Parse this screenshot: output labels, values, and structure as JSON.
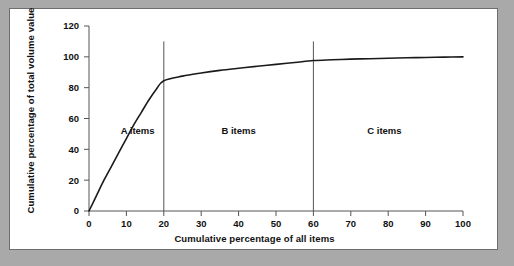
{
  "figure": {
    "background_color": "#a9a9a9",
    "panel_color": "#ffffff",
    "panel_border_color": "#6e6e6e"
  },
  "chart_data": {
    "type": "line",
    "title": "",
    "subtitle": "",
    "xlabel": "Cumulative percentage of all items",
    "ylabel": "Cumulative percentage of total volume value",
    "xlim": [
      0,
      100
    ],
    "ylim": [
      0,
      120
    ],
    "xticks": [
      0,
      10,
      20,
      30,
      40,
      50,
      60,
      70,
      80,
      90,
      100
    ],
    "yticks": [
      0,
      20,
      40,
      60,
      80,
      100,
      120
    ],
    "xtick_labels": [
      "0",
      "10",
      "20",
      "30",
      "40",
      "50",
      "60",
      "70",
      "80",
      "90",
      "100"
    ],
    "ytick_labels": [
      "0",
      "20",
      "40",
      "60",
      "80",
      "100",
      "120"
    ],
    "grid": false,
    "legend": false,
    "legend_position": "none",
    "line_color": "#1a1a1a",
    "line_width": 1.6,
    "series": [
      {
        "name": "Cumulative value curve",
        "x": [
          0,
          2,
          4,
          6,
          8,
          10,
          12,
          14,
          16,
          18,
          20,
          25,
          30,
          35,
          40,
          45,
          50,
          55,
          60,
          65,
          70,
          75,
          80,
          85,
          90,
          95,
          100
        ],
        "values": [
          0,
          10,
          20,
          29,
          38,
          47,
          56,
          64,
          72,
          79,
          84.5,
          87.5,
          89.5,
          91.2,
          92.6,
          93.9,
          95.1,
          96.3,
          97.6,
          98.1,
          98.5,
          98.8,
          99.1,
          99.4,
          99.6,
          99.8,
          100
        ]
      }
    ],
    "annotations": [
      {
        "text": "A items",
        "x": 13,
        "y": 50
      },
      {
        "text": "B items",
        "x": 40,
        "y": 50
      },
      {
        "text": "C items",
        "x": 79,
        "y": 50
      }
    ],
    "dividers": [
      {
        "x": 20,
        "y_from": 0,
        "y_to": 110,
        "color": "#555555"
      },
      {
        "x": 60,
        "y_from": 0,
        "y_to": 110,
        "color": "#555555"
      }
    ]
  }
}
